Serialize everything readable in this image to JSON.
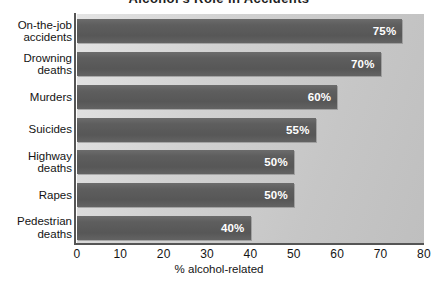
{
  "chart_data": {
    "type": "bar",
    "orientation": "horizontal",
    "title": "Alcohol's Role in Accidents",
    "xlabel": "% alcohol-related",
    "ylabel": "",
    "xlim": [
      0,
      80
    ],
    "xticks": [
      0,
      10,
      20,
      30,
      40,
      50,
      60,
      70,
      80
    ],
    "xtick_labels": [
      "0",
      "10",
      "20",
      "30",
      "40",
      "50",
      "60",
      "70",
      "80"
    ],
    "grid": false,
    "legend": false,
    "categories": [
      "On-the-job\naccidents",
      "Drowning\ndeaths",
      "Murders",
      "Suicides",
      "Highway\ndeaths",
      "Rapes",
      "Pedestrian\ndeaths"
    ],
    "values": [
      75,
      70,
      60,
      55,
      50,
      50,
      40
    ],
    "data_labels": [
      "75%",
      "70%",
      "60%",
      "55%",
      "50%",
      "50%",
      "40%"
    ],
    "colors": {
      "bar": "#5e5e5e",
      "plot_background": "#d2d2d2",
      "axis": "#555555",
      "data_label_text": "#ffffff",
      "text": "#141414"
    }
  }
}
